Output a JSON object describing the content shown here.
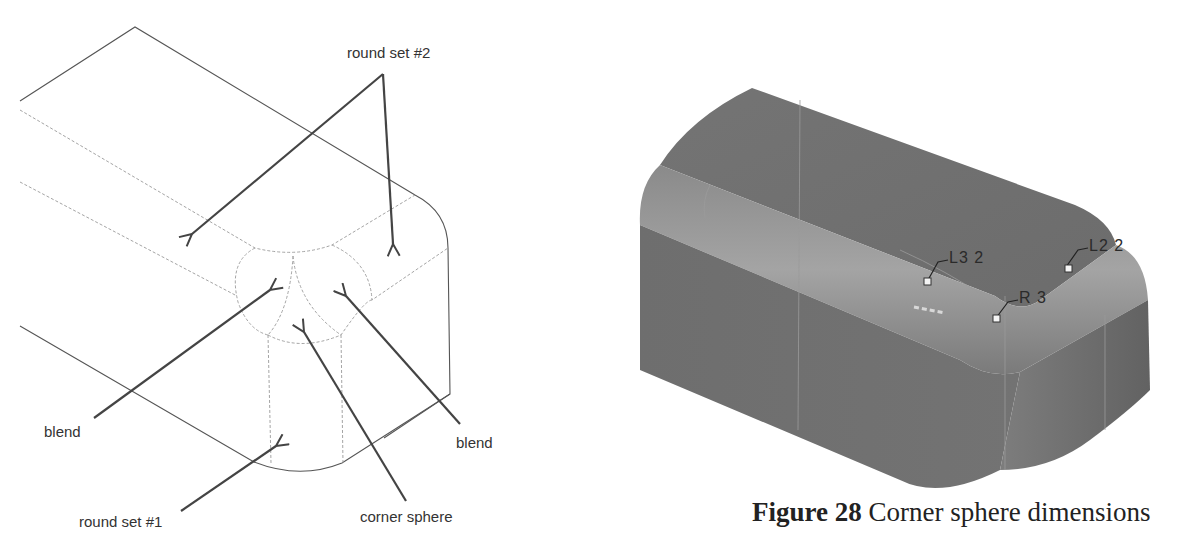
{
  "left_figure": {
    "labels": {
      "round_set_2": "round set #2",
      "blend_left": "blend",
      "blend_right": "blend",
      "round_set_1": "round set #1",
      "corner_sphere": "corner sphere"
    }
  },
  "right_figure": {
    "dimensions": {
      "l3": "L3 2",
      "l2": "L2 2",
      "r": "R 3"
    },
    "caption": {
      "figure_label": "Figure 28",
      "text": " Corner sphere dimensions"
    }
  },
  "colors": {
    "line": "#555555",
    "dashed": "#9a9a9a",
    "arrow": "#444444",
    "solid_body": "#7a7a7a"
  }
}
